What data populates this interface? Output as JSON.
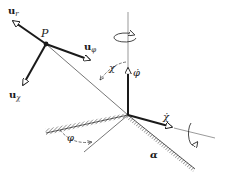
{
  "diagram": {
    "type": "rotating-frame / spherical unit vectors",
    "point_label": "P",
    "unit_vectors": [
      {
        "id": "u_r",
        "base": "u",
        "sub": "r"
      },
      {
        "id": "u_phi",
        "base": "u",
        "sub": "φ"
      },
      {
        "id": "u_chi",
        "base": "u",
        "sub": "χ"
      }
    ],
    "angles": {
      "chi": "χ",
      "phi": "φ",
      "alpha": "α"
    },
    "rates": {
      "phi_dot": "φ̇",
      "chi_dot": "χ̇"
    },
    "colors": {
      "ink": "#1a1a1a",
      "background": "#ffffff"
    }
  }
}
